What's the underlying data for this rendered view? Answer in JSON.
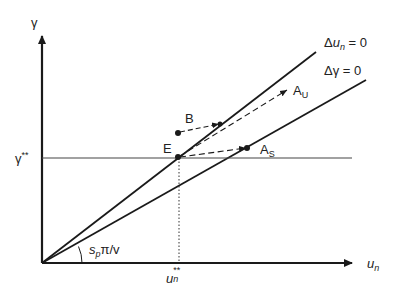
{
  "diagram": {
    "axes": {
      "y_label": "γ",
      "x_label_base": "u",
      "x_label_sub": "n"
    },
    "lines": {
      "upper": {
        "label_prefix": "Δ",
        "label_var": "u",
        "label_sub": "n",
        "label_suffix": " = 0"
      },
      "lower": {
        "label": "Δγ = 0"
      }
    },
    "reference": {
      "gamma_star_base": "γ",
      "gamma_star_sup": "**",
      "u_star_base": "u",
      "u_star_sub": "n",
      "u_star_sup": "**"
    },
    "points": {
      "E": "E",
      "B": "B",
      "AU_base": "A",
      "AU_sub": "U",
      "AS_base": "A",
      "AS_sub": "S"
    },
    "angle": {
      "s": "s",
      "s_sub": "p",
      "rest": "π/v"
    },
    "colors": {
      "line": "#1a1a1a",
      "text": "#222222",
      "background": "#ffffff"
    }
  }
}
